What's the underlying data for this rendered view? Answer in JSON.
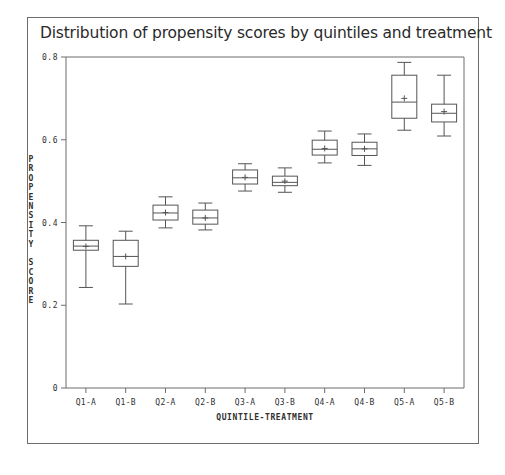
{
  "chart_data": {
    "type": "boxplot",
    "title": "Distribution of propensity scores by quintiles and treatment",
    "xlabel": "QUINTILE-TREATMENT",
    "ylabel": "PROPENSITY SCORE",
    "ylabel_letters": [
      "P",
      "R",
      "O",
      "P",
      "E",
      "N",
      "S",
      "I",
      "T",
      "Y",
      " ",
      "S",
      "C",
      "O",
      "R",
      "E"
    ],
    "ylim": [
      0,
      0.8
    ],
    "ytick_labels": [
      "0",
      "0.2",
      "0.4",
      "0.6",
      "0.8"
    ],
    "ytick_values": [
      0,
      0.2,
      0.4,
      0.6,
      0.8
    ],
    "grid": false,
    "legend": "none",
    "categories": [
      "Q1-A",
      "Q1-B",
      "Q2-A",
      "Q2-B",
      "Q3-A",
      "Q3-B",
      "Q4-A",
      "Q4-B",
      "Q5-A",
      "Q5-B"
    ],
    "boxes": [
      {
        "label": "Q1-A",
        "whisker_low": 0.243,
        "q1": 0.333,
        "median": 0.343,
        "q3": 0.357,
        "whisker_high": 0.392,
        "mean": 0.342
      },
      {
        "label": "Q1-B",
        "whisker_low": 0.203,
        "q1": 0.294,
        "median": 0.318,
        "q3": 0.357,
        "whisker_high": 0.379,
        "mean": 0.318
      },
      {
        "label": "Q2-A",
        "whisker_low": 0.387,
        "q1": 0.406,
        "median": 0.423,
        "q3": 0.442,
        "whisker_high": 0.462,
        "mean": 0.424
      },
      {
        "label": "Q2-B",
        "whisker_low": 0.382,
        "q1": 0.396,
        "median": 0.411,
        "q3": 0.43,
        "whisker_high": 0.447,
        "mean": 0.411
      },
      {
        "label": "Q3-A",
        "whisker_low": 0.476,
        "q1": 0.493,
        "median": 0.508,
        "q3": 0.527,
        "whisker_high": 0.542,
        "mean": 0.509
      },
      {
        "label": "Q3-B",
        "whisker_low": 0.473,
        "q1": 0.489,
        "median": 0.497,
        "q3": 0.512,
        "whisker_high": 0.532,
        "mean": 0.5
      },
      {
        "label": "Q4-A",
        "whisker_low": 0.544,
        "q1": 0.563,
        "median": 0.577,
        "q3": 0.599,
        "whisker_high": 0.621,
        "mean": 0.579
      },
      {
        "label": "Q4-B",
        "whisker_low": 0.538,
        "q1": 0.562,
        "median": 0.578,
        "q3": 0.594,
        "whisker_high": 0.614,
        "mean": 0.578
      },
      {
        "label": "Q5-A",
        "whisker_low": 0.623,
        "q1": 0.652,
        "median": 0.691,
        "q3": 0.756,
        "whisker_high": 0.787,
        "mean": 0.7
      },
      {
        "label": "Q5-B",
        "whisker_low": 0.609,
        "q1": 0.643,
        "median": 0.664,
        "q3": 0.686,
        "whisker_high": 0.756,
        "mean": 0.668
      }
    ],
    "colors": {
      "box_stroke": "#555555",
      "axis": "#6c6c6c",
      "text": "#303030",
      "title": "#2a2a2a",
      "background": "#ffffff"
    }
  }
}
